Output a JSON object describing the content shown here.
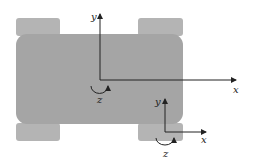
{
  "diagram": {
    "type": "vehicle-coordinate-frames",
    "colors": {
      "background": "#ffffff",
      "body": "#a5a5a5",
      "wheel": "#b4b4b4",
      "axis": "#222222"
    },
    "wheels": [
      {
        "position": "front-left"
      },
      {
        "position": "front-right"
      },
      {
        "position": "rear-left"
      },
      {
        "position": "rear-right"
      }
    ],
    "frames": [
      {
        "name": "body-frame",
        "axes": {
          "x": "x",
          "y": "y",
          "z": "z"
        }
      },
      {
        "name": "wheel-frame",
        "axes": {
          "x": "x",
          "y": "y",
          "z": "z"
        }
      }
    ]
  }
}
